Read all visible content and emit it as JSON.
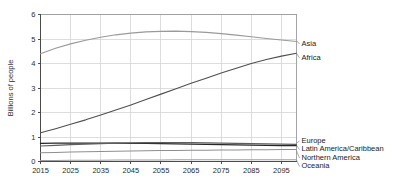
{
  "chart_data": {
    "type": "line",
    "title": "",
    "subtitle": "",
    "xlabel": "",
    "ylabel": "Billions of people",
    "xlim": [
      2015,
      2100
    ],
    "ylim": [
      0,
      6
    ],
    "grid": true,
    "legend_position": "right-inline",
    "x_ticks": [
      "2015",
      "2025",
      "2035",
      "2045",
      "2055",
      "2065",
      "2075",
      "2085",
      "2095"
    ],
    "x_tick_values": [
      2015,
      2025,
      2035,
      2045,
      2055,
      2065,
      2075,
      2085,
      2095
    ],
    "y_ticks": [
      "0",
      "1",
      "2",
      "3",
      "4",
      "5",
      "6"
    ],
    "y_tick_values": [
      0,
      1,
      2,
      3,
      4,
      5,
      6
    ],
    "x": [
      2015,
      2020,
      2025,
      2030,
      2035,
      2040,
      2045,
      2050,
      2055,
      2060,
      2065,
      2070,
      2075,
      2080,
      2085,
      2090,
      2095,
      2100
    ],
    "series": [
      {
        "name": "Asia",
        "color": "#9a9a9a",
        "width": 1.1,
        "label_x": 2100,
        "label_y": 4.93,
        "values": [
          4.4,
          4.62,
          4.8,
          4.95,
          5.07,
          5.17,
          5.24,
          5.29,
          5.31,
          5.32,
          5.3,
          5.27,
          5.22,
          5.16,
          5.09,
          5.02,
          4.96,
          4.9
        ]
      },
      {
        "name": "Africa",
        "color": "#4f4f4f",
        "width": 1.1,
        "label_x": 2100,
        "label_y": 4.42,
        "values": [
          1.17,
          1.34,
          1.52,
          1.7,
          1.9,
          2.1,
          2.31,
          2.53,
          2.75,
          2.97,
          3.19,
          3.4,
          3.61,
          3.81,
          4.0,
          4.16,
          4.3,
          4.42
        ]
      },
      {
        "name": "Europe",
        "color": "#262626",
        "width": 1.3,
        "label_x": 2100,
        "label_y": 0.75,
        "values": [
          0.74,
          0.75,
          0.75,
          0.75,
          0.75,
          0.75,
          0.74,
          0.74,
          0.73,
          0.72,
          0.71,
          0.7,
          0.69,
          0.68,
          0.67,
          0.66,
          0.65,
          0.65
        ]
      },
      {
        "name": "Latin America/Caribbean",
        "color": "#5e5e5e",
        "width": 1.1,
        "label_x": 2100,
        "label_y": 0.66,
        "values": [
          0.63,
          0.66,
          0.69,
          0.71,
          0.73,
          0.75,
          0.76,
          0.77,
          0.77,
          0.77,
          0.77,
          0.76,
          0.75,
          0.74,
          0.73,
          0.72,
          0.71,
          0.7
        ]
      },
      {
        "name": "Northern America",
        "color": "#8f8f8f",
        "width": 1.1,
        "label_x": 2100,
        "label_y": 0.44,
        "values": [
          0.36,
          0.37,
          0.39,
          0.4,
          0.41,
          0.42,
          0.43,
          0.44,
          0.45,
          0.45,
          0.46,
          0.46,
          0.47,
          0.47,
          0.48,
          0.48,
          0.49,
          0.49
        ]
      },
      {
        "name": "Oceania",
        "color": "#9e9e9e",
        "width": 1.1,
        "label_x": 2100,
        "label_y": 0.06,
        "values": [
          0.04,
          0.04,
          0.05,
          0.05,
          0.05,
          0.06,
          0.06,
          0.06,
          0.06,
          0.07,
          0.07,
          0.07,
          0.07,
          0.07,
          0.07,
          0.07,
          0.07,
          0.07
        ]
      }
    ]
  }
}
